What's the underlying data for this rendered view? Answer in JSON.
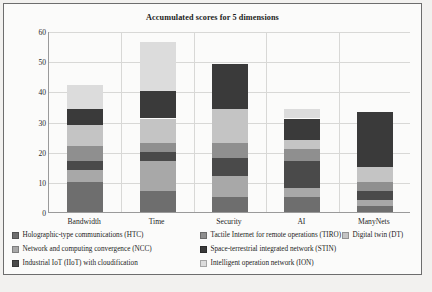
{
  "chart_data": {
    "type": "bar",
    "subtype": "stacked-bar",
    "title": "Accumulated scores for 5 dimensions",
    "xlabel": "",
    "ylabel": "",
    "ylim": [
      0,
      60
    ],
    "yticks": [
      0,
      10,
      20,
      30,
      40,
      50,
      60
    ],
    "grid": true,
    "legend_position": "bottom",
    "categories": [
      "Bandwidth",
      "Time",
      "Security",
      "AI",
      "ManyNets"
    ],
    "series": [
      {
        "name": "Holographic-type communications (HTC)",
        "abbr": "HTC",
        "color": "#6e6e6e",
        "values": [
          10,
          7,
          5,
          5,
          2
        ]
      },
      {
        "name": "Network and computing convergence (NCC)",
        "abbr": "NCC",
        "color": "#a8a8a8",
        "values": [
          4,
          10,
          7,
          3,
          2
        ]
      },
      {
        "name": "Industrial IoT (IIoT) with cloudification",
        "abbr": "IIoT",
        "color": "#4a4a4a",
        "values": [
          3,
          3,
          6,
          9,
          3
        ]
      },
      {
        "name": "Tactile Internet for remote operations (TIRO)",
        "abbr": "TIRO",
        "color": "#8f8f8f",
        "values": [
          5,
          3,
          5,
          4,
          3
        ]
      },
      {
        "name": "Digital twin (DT)",
        "abbr": "DT",
        "color": "#c4c4c4",
        "values": [
          7,
          8,
          11,
          3,
          5
        ]
      },
      {
        "name": "Space-terrestrial integrated network (STIN)",
        "abbr": "STIN",
        "color": "#3a3a3a",
        "values": [
          5,
          9,
          15,
          7,
          18
        ]
      },
      {
        "name": "Intelligent operation network (ION)",
        "abbr": "ION",
        "color": "#dcdcdc",
        "values": [
          8,
          16.5,
          0,
          3,
          0
        ]
      }
    ],
    "totals": [
      42,
      56.5,
      49,
      34,
      33
    ]
  },
  "legend": {
    "items": [
      {
        "label": "Holographic-type communications (HTC)",
        "color": "#6e6e6e"
      },
      {
        "label": "Tactile Internet for remote operations (TIRO)",
        "color": "#8f8f8f"
      },
      {
        "label": "Digital twin (DT)",
        "color": "#c4c4c4"
      },
      {
        "label": "Network and computing convergence (NCC)",
        "color": "#a8a8a8"
      },
      {
        "label": "Space-terrestrial integrated network (STIN)",
        "color": "#3a3a3a"
      },
      {
        "label": "Industrial IoT (IIoT) with cloudification",
        "color": "#4a4a4a"
      },
      {
        "label": "Intelligent operation network (ION)",
        "color": "#dcdcdc"
      }
    ]
  },
  "axis": {
    "y_tick_labels": [
      "60",
      "50",
      "40",
      "30",
      "20",
      "10",
      "0"
    ],
    "x_tick_labels": [
      "Bandwidth",
      "Time",
      "Security",
      "AI",
      "ManyNets"
    ]
  },
  "footer": {
    "watermark": ""
  }
}
